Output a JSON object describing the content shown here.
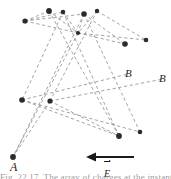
{
  "figure": {
    "type": "physics-trajectory-diagram",
    "width": 171,
    "height": 179,
    "background_color": "#ffffff",
    "dash_color": "#8c8c8c",
    "dot_color": "#2b2b2b",
    "arrow_color": "#1a1a1a"
  },
  "labels": {
    "point_a": "A",
    "point_b_inner": "B",
    "point_b_outer": "B",
    "field_vector": "E"
  },
  "caption": {
    "text": "Fig. 22.17.  The  array  of  charges  at  the  instant"
  },
  "nodes": [
    {
      "id": "n1",
      "x": 25,
      "y": 21,
      "r": 2.6
    },
    {
      "id": "n2",
      "x": 49,
      "y": 11,
      "r": 2.9
    },
    {
      "id": "n3",
      "x": 63,
      "y": 12,
      "r": 2.3
    },
    {
      "id": "n4",
      "x": 84,
      "y": 14,
      "r": 2.8
    },
    {
      "id": "n5",
      "x": 97,
      "y": 11,
      "r": 2.2
    },
    {
      "id": "n6",
      "x": 78,
      "y": 33,
      "r": 2.1
    },
    {
      "id": "n7",
      "x": 125,
      "y": 44,
      "r": 2.8
    },
    {
      "id": "n8",
      "x": 146,
      "y": 40,
      "r": 2.3
    },
    {
      "id": "n9",
      "x": 22,
      "y": 100,
      "r": 2.8
    },
    {
      "id": "n10",
      "x": 50,
      "y": 101,
      "r": 2.6
    },
    {
      "id": "n11",
      "x": 119,
      "y": 136,
      "r": 2.9
    },
    {
      "id": "n12",
      "x": 140,
      "y": 132,
      "r": 2.3
    },
    {
      "id": "n13",
      "x": 13,
      "y": 157,
      "r": 2.9
    }
  ],
  "dashed_lines": [
    {
      "id": "l1",
      "x1": 25,
      "y1": 21,
      "x2": 49,
      "y2": 11
    },
    {
      "id": "l2",
      "x1": 25,
      "y1": 21,
      "x2": 63,
      "y2": 12
    },
    {
      "id": "l3",
      "x1": 25,
      "y1": 21,
      "x2": 78,
      "y2": 33
    },
    {
      "id": "l4",
      "x1": 25,
      "y1": 21,
      "x2": 84,
      "y2": 14
    },
    {
      "id": "l5",
      "x1": 49,
      "y1": 11,
      "x2": 78,
      "y2": 33
    },
    {
      "id": "l6",
      "x1": 63,
      "y1": 12,
      "x2": 78,
      "y2": 33
    },
    {
      "id": "l7",
      "x1": 84,
      "y1": 14,
      "x2": 78,
      "y2": 33
    },
    {
      "id": "l8",
      "x1": 97,
      "y1": 11,
      "x2": 78,
      "y2": 33
    },
    {
      "id": "l9",
      "x1": 84,
      "y1": 14,
      "x2": 125,
      "y2": 44
    },
    {
      "id": "l10",
      "x1": 97,
      "y1": 11,
      "x2": 146,
      "y2": 40
    },
    {
      "id": "l11",
      "x1": 78,
      "y1": 33,
      "x2": 125,
      "y2": 44
    },
    {
      "id": "l12",
      "x1": 78,
      "y1": 33,
      "x2": 146,
      "y2": 40
    },
    {
      "id": "l13",
      "x1": 49,
      "y1": 11,
      "x2": 119,
      "y2": 136
    },
    {
      "id": "l14",
      "x1": 63,
      "y1": 12,
      "x2": 119,
      "y2": 136
    },
    {
      "id": "l15",
      "x1": 84,
      "y1": 14,
      "x2": 140,
      "y2": 132
    },
    {
      "id": "l16",
      "x1": 84,
      "y1": 14,
      "x2": 13,
      "y2": 157
    },
    {
      "id": "l17",
      "x1": 78,
      "y1": 33,
      "x2": 13,
      "y2": 157
    },
    {
      "id": "l18",
      "x1": 22,
      "y1": 100,
      "x2": 119,
      "y2": 136
    },
    {
      "id": "l19",
      "x1": 22,
      "y1": 100,
      "x2": 140,
      "y2": 132
    },
    {
      "id": "l20",
      "x1": 50,
      "y1": 101,
      "x2": 119,
      "y2": 136
    },
    {
      "id": "l21",
      "x1": 22,
      "y1": 100,
      "x2": 128,
      "y2": 74
    },
    {
      "id": "l22",
      "x1": 50,
      "y1": 101,
      "x2": 163,
      "y2": 79
    },
    {
      "id": "l23",
      "x1": 63,
      "y1": 12,
      "x2": 22,
      "y2": 100
    },
    {
      "id": "l24",
      "x1": 97,
      "y1": 11,
      "x2": 50,
      "y2": 101
    },
    {
      "id": "l25",
      "x1": 50,
      "y1": 101,
      "x2": 13,
      "y2": 157
    }
  ],
  "field_arrow": {
    "x_tip": 86,
    "x_tail": 134,
    "y": 157,
    "direction": "left"
  }
}
